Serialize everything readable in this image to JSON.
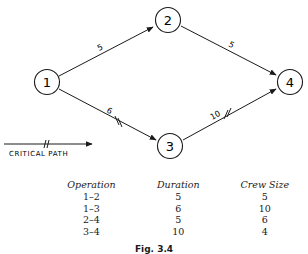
{
  "diagram": {
    "nodes": [
      {
        "id": "1",
        "label": "1"
      },
      {
        "id": "2",
        "label": "2"
      },
      {
        "id": "3",
        "label": "3"
      },
      {
        "id": "4",
        "label": "4"
      }
    ],
    "edges": [
      {
        "from": "1",
        "to": "2",
        "duration_label": "5",
        "critical": false
      },
      {
        "from": "2",
        "to": "4",
        "duration_label": "5",
        "critical": false
      },
      {
        "from": "1",
        "to": "3",
        "duration_label": "6",
        "critical": true
      },
      {
        "from": "3",
        "to": "4",
        "duration_label": "10",
        "critical": true
      }
    ],
    "legend": {
      "label": "CRITICAL PATH"
    }
  },
  "table": {
    "headers": [
      "Operation",
      "Duration",
      "Crew Size"
    ],
    "rows": [
      [
        "1–2",
        "5",
        "5"
      ],
      [
        "1–3",
        "6",
        "10"
      ],
      [
        "2–4",
        "5",
        "6"
      ],
      [
        "3–4",
        "10",
        "4"
      ]
    ]
  },
  "caption": "Fig. 3.4"
}
